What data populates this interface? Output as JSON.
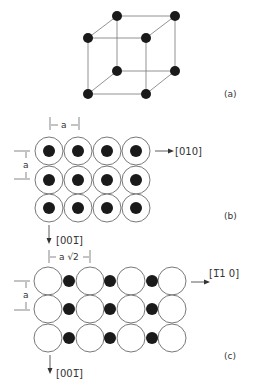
{
  "panels": {
    "a": {
      "label": "(a)",
      "description": "simple cubic unit cell with 8 corner atoms"
    },
    "b": {
      "label": "(b)",
      "spacing_label": "a",
      "vertical_spacing_label": "a",
      "direction_right": "[010]",
      "direction_down": "[001̅]",
      "rows": 3,
      "cols": 4
    },
    "c": {
      "label": "(c)",
      "spacing_label": "a √2",
      "vertical_spacing_label": "a",
      "direction_right": "[1̅1 0]",
      "direction_down": "[001̅]",
      "rows": 3,
      "cols": 4
    }
  },
  "colors": {
    "line": "#555555",
    "atom": "#1a1a1a"
  }
}
